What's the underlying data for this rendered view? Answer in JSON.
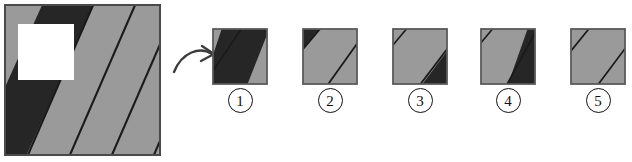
{
  "figure": {
    "kind": "pattern-completion-puzzle",
    "colors": {
      "gray": "#9a9a9a",
      "gray_light": "#a6a6a6",
      "dark": "#262626",
      "line": "#1a1a1a",
      "border": "#4a4a4a",
      "white": "#ffffff",
      "background": "#ffffff",
      "label_color": "#111111"
    },
    "main_square": {
      "name": "striped-square-with-cutout",
      "description": "Large gray square filled with parallel diagonal stripes running lower-left to upper-right; one wide black stripe near the left side; a white square hole is cut out of the upper-left region.",
      "stripe_angle_degrees": 55,
      "cutout": {
        "shape": "square",
        "position": "upper-left",
        "fill": "#ffffff"
      }
    },
    "arrow": {
      "name": "curved-right-arrow",
      "direction": "right",
      "style": "curved"
    },
    "options": [
      {
        "id": "1",
        "label": "1",
        "pattern": "wide black diagonal band covering most of the tile, thin gray margins at upper-left and lower-right"
      },
      {
        "id": "2",
        "label": "2",
        "pattern": "small black triangle at upper-left corner, gray field with one thin diagonal line toward lower-right"
      },
      {
        "id": "3",
        "label": "3",
        "pattern": "gray field with a thin diagonal line at upper-left and a large black triangle filling the lower-right corner"
      },
      {
        "id": "4",
        "label": "4",
        "pattern": "gray field at left with a thin diagonal line, wide black diagonal band along the right edge"
      },
      {
        "id": "5",
        "label": "5",
        "pattern": "all gray with two thin diagonal lines, no black band"
      }
    ]
  }
}
